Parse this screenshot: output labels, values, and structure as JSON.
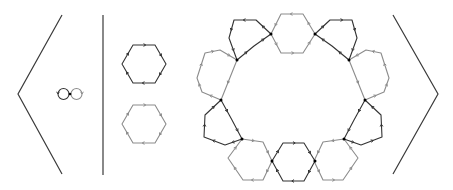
{
  "colors": {
    "background": "#ffffff",
    "dark": "#333333",
    "gray": "#8c8c8c",
    "dot": "#000000",
    "bracket": "#3a3a3a"
  },
  "diagram": {
    "left_bracket": {
      "points": [
        [
          62,
          15
        ],
        [
          18,
          94
        ],
        [
          62,
          174
        ]
      ]
    },
    "right_bracket": {
      "points": [
        [
          393,
          15
        ],
        [
          438,
          94
        ],
        [
          393,
          174
        ]
      ]
    },
    "separator": {
      "x": 103,
      "y1": 15,
      "y2": 175
    },
    "generators": {
      "circles": [
        {
          "name": "generator-a-loop",
          "color": "dark",
          "cx": 63.5,
          "cy": 94,
          "r": 5.5,
          "arrow_angle": 180,
          "direction": "ccw"
        },
        {
          "name": "generator-b-loop",
          "color": "gray",
          "cx": 76.5,
          "cy": 94,
          "r": 5.5,
          "arrow_angle": 0,
          "direction": "cw"
        }
      ],
      "basepoint": [
        70,
        94
      ]
    },
    "relators": [
      {
        "name": "relator-hexagon-dark",
        "color": "dark",
        "points": [
          [
            133,
            45
          ],
          [
            155,
            45
          ],
          [
            166,
            64
          ],
          [
            155,
            83
          ],
          [
            133,
            83
          ],
          [
            122,
            64
          ]
        ]
      },
      {
        "name": "relator-hexagon-gray",
        "color": "gray",
        "points": [
          [
            133,
            105
          ],
          [
            155,
            105
          ],
          [
            166,
            124
          ],
          [
            155,
            143
          ],
          [
            133,
            143
          ],
          [
            122,
            124
          ]
        ]
      }
    ],
    "ring": {
      "cells": [
        {
          "name": "ring-cell-dark-top-left",
          "color": "dark",
          "points": [
            [
              256,
              20
            ],
            [
              234,
              20
            ],
            [
              229,
              38
            ],
            [
              237,
              60
            ],
            [
              254,
              46
            ],
            [
              271,
              34
            ]
          ]
        },
        {
          "name": "ring-cell-gray-top",
          "color": "gray",
          "points": [
            [
              303,
              14
            ],
            [
              281,
              14
            ],
            [
              271,
              34
            ],
            [
              281,
              53
            ],
            [
              303,
              53
            ],
            [
              315,
              34
            ]
          ]
        },
        {
          "name": "ring-cell-dark-top-right",
          "color": "dark",
          "points": [
            [
              330,
              20
            ],
            [
              352,
              20
            ],
            [
              357,
              38
            ],
            [
              349,
              60
            ],
            [
              332,
              46
            ],
            [
              315,
              34
            ]
          ]
        },
        {
          "name": "ring-cell-gray-left",
          "color": "gray",
          "points": [
            [
              205,
              53
            ],
            [
              220,
              50
            ],
            [
              237,
              60
            ],
            [
              221,
              100
            ],
            [
              202,
              92
            ],
            [
              197,
              78
            ]
          ]
        },
        {
          "name": "ring-cell-gray-right",
          "color": "gray",
          "points": [
            [
              381,
              53
            ],
            [
              366,
              50
            ],
            [
              349,
              60
            ],
            [
              365,
              100
            ],
            [
              384,
              92
            ],
            [
              389,
              78
            ]
          ]
        },
        {
          "name": "ring-cell-dark-left",
          "color": "dark",
          "points": [
            [
              221,
              100
            ],
            [
              232,
              120
            ],
            [
              242,
              139
            ],
            [
              225,
              145
            ],
            [
              204,
              137
            ],
            [
              205,
              115
            ]
          ]
        },
        {
          "name": "ring-cell-dark-right",
          "color": "dark",
          "points": [
            [
              365,
              100
            ],
            [
              354,
              120
            ],
            [
              344,
              139
            ],
            [
              361,
              145
            ],
            [
              382,
              137
            ],
            [
              381,
              115
            ]
          ]
        },
        {
          "name": "ring-cell-gray-bottom-left",
          "color": "gray",
          "points": [
            [
              242,
              139
            ],
            [
              263,
              142
            ],
            [
              272,
              161
            ],
            [
              263,
              180
            ],
            [
              243,
              180
            ],
            [
              228,
              158
            ]
          ]
        },
        {
          "name": "ring-cell-gray-bottom-right",
          "color": "gray",
          "points": [
            [
              344,
              139
            ],
            [
              323,
              142
            ],
            [
              314,
              161
            ],
            [
              323,
              180
            ],
            [
              343,
              180
            ],
            [
              358,
              158
            ]
          ]
        },
        {
          "name": "ring-cell-dark-bottom",
          "color": "dark",
          "points": [
            [
              283,
              143
            ],
            [
              304,
              143
            ],
            [
              315,
              161
            ],
            [
              304,
              181
            ],
            [
              283,
              181
            ],
            [
              272,
              161
            ]
          ]
        }
      ],
      "junctions": [
        [
          271,
          34
        ],
        [
          315,
          34
        ],
        [
          237,
          60
        ],
        [
          349,
          60
        ],
        [
          221,
          100
        ],
        [
          365,
          100
        ],
        [
          242,
          139
        ],
        [
          344,
          139
        ],
        [
          272,
          161
        ],
        [
          315,
          161
        ]
      ]
    }
  }
}
